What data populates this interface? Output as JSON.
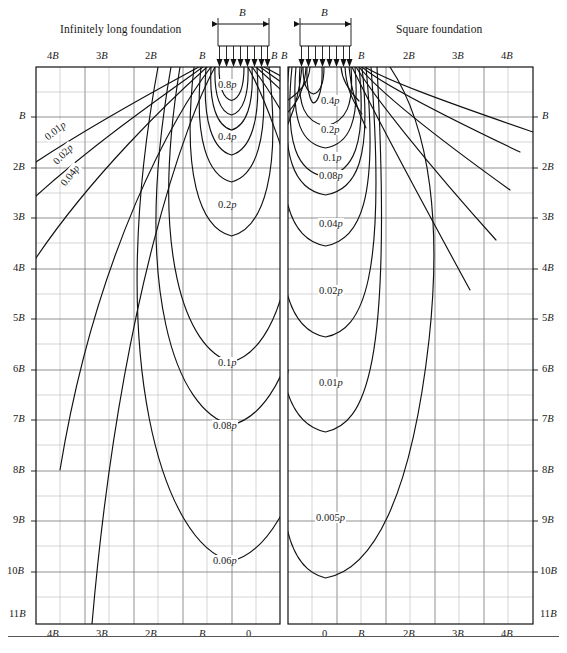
{
  "figure": {
    "left_panel_title": "Infinitely long foundation",
    "right_panel_title": "Square foundation",
    "width_symbol": "B",
    "caption": ""
  },
  "axes": {
    "top_left_ticks": [
      "4B",
      "3B",
      "2B",
      "B",
      "B"
    ],
    "top_right_edge_label": "B",
    "top_right_ticks": [
      "B",
      "2B",
      "3B",
      "4B"
    ],
    "bottom_left_ticks": [
      "4B",
      "3B",
      "2B",
      "B",
      "0"
    ],
    "bottom_right_ticks": [
      "0",
      "B",
      "2B",
      "3B",
      "4B"
    ],
    "depth_ticks": [
      "B",
      "2B",
      "3B",
      "4B",
      "5B",
      "6B",
      "7B",
      "8B",
      "9B",
      "10B",
      "11B"
    ]
  },
  "left_contours": [
    {
      "label": "0.8p",
      "value": 0.8
    },
    {
      "label": "0.4p",
      "value": 0.4
    },
    {
      "label": "0.2p",
      "value": 0.2
    },
    {
      "label": "0.1p",
      "value": 0.1
    },
    {
      "label": "0.08p",
      "value": 0.08
    },
    {
      "label": "0.06p",
      "value": 0.06
    },
    {
      "label": "0.04p",
      "value": 0.04
    },
    {
      "label": "0.02p",
      "value": 0.02
    },
    {
      "label": "0.01p",
      "value": 0.01
    }
  ],
  "right_contours": [
    {
      "label": "0.4p",
      "value": 0.4
    },
    {
      "label": "0.2p",
      "value": 0.2
    },
    {
      "label": "0.1p",
      "value": 0.1
    },
    {
      "label": "0.08p",
      "value": 0.08
    },
    {
      "label": "0.04p",
      "value": 0.04
    },
    {
      "label": "0.02p",
      "value": 0.02
    },
    {
      "label": "0.01p",
      "value": 0.01
    },
    {
      "label": "0.005p",
      "value": 0.005
    }
  ],
  "chart_data": {
    "type": "line",
    "xlabel": "Horizontal distance from centerline (multiples of B)",
    "ylabel": "Depth below foundation (multiples of B)",
    "xlim": [
      -4.5,
      4.5
    ],
    "ylim": [
      0,
      11.5
    ],
    "grid": true,
    "legend": "none",
    "panels": [
      {
        "name": "Infinitely long foundation",
        "x_ticks": [
          "4B",
          "3B",
          "2B",
          "B",
          "0"
        ],
        "y_ticks": [
          "B",
          "2B",
          "3B",
          "4B",
          "5B",
          "6B",
          "7B",
          "8B",
          "9B",
          "10B",
          "11B"
        ],
        "series": [
          {
            "name": "0.8p",
            "value": 0.8,
            "max_depth_B": 0.85,
            "half_width_B": 0.45
          },
          {
            "name": "0.4p",
            "value": 0.4,
            "max_depth_B": 1.9,
            "half_width_B": 0.82
          },
          {
            "name": "0.2p",
            "value": 0.2,
            "max_depth_B": 3.4,
            "half_width_B": 1.3
          },
          {
            "name": "0.1p",
            "value": 0.1,
            "max_depth_B": 6.3,
            "half_width_B": 2.1
          },
          {
            "name": "0.08p",
            "value": 0.08,
            "max_depth_B": 7.7,
            "half_width_B": 2.5
          },
          {
            "name": "0.06p",
            "value": 0.06,
            "max_depth_B": 10.6,
            "half_width_B": 3.2
          },
          {
            "name": "0.04p",
            "value": 0.04,
            "open_ray_angle_deg": 52
          },
          {
            "name": "0.02p",
            "value": 0.02,
            "open_ray_angle_deg": 46
          },
          {
            "name": "0.01p",
            "value": 0.01,
            "open_ray_angle_deg": 38
          }
        ]
      },
      {
        "name": "Square foundation",
        "x_ticks": [
          "0",
          "B",
          "2B",
          "3B",
          "4B"
        ],
        "y_ticks": [
          "B",
          "2B",
          "3B",
          "4B",
          "5B",
          "6B",
          "7B",
          "8B",
          "9B",
          "10B",
          "11B"
        ],
        "series": [
          {
            "name": "0.4p",
            "value": 0.4,
            "max_depth_B": 0.95,
            "half_width_B": 0.5
          },
          {
            "name": "0.2p",
            "value": 0.2,
            "max_depth_B": 1.45,
            "half_width_B": 0.68
          },
          {
            "name": "0.1p",
            "value": 0.1,
            "max_depth_B": 2.1,
            "half_width_B": 0.9
          },
          {
            "name": "0.08p",
            "value": 0.08,
            "max_depth_B": 2.45,
            "half_width_B": 1.02
          },
          {
            "name": "0.04p",
            "value": 0.04,
            "max_depth_B": 3.5,
            "half_width_B": 1.45
          },
          {
            "name": "0.02p",
            "value": 0.02,
            "max_depth_B": 5.2,
            "half_width_B": 2.1
          },
          {
            "name": "0.01p",
            "value": 0.01,
            "max_depth_B": 7.1,
            "half_width_B": 2.9
          },
          {
            "name": "0.005p",
            "value": 0.005,
            "max_depth_B": 10.4,
            "half_width_B": 4.0
          }
        ]
      }
    ]
  }
}
